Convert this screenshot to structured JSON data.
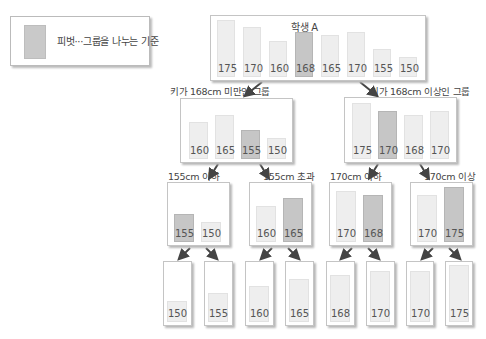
{
  "legend": {
    "label": "피벗···그룹을 나누는 기준",
    "swatch_color": "#c6c6c6"
  },
  "colors": {
    "bar": "#eeeeee",
    "pivot": "#c6c6c6",
    "arrow": "#444444"
  },
  "root": {
    "title": "학생 A",
    "values": [
      "175",
      "170",
      "160",
      "168",
      "165",
      "170",
      "155",
      "150"
    ],
    "pivot_index": 3
  },
  "level1": [
    {
      "label": "키가 168cm 미만인 그룹",
      "values": [
        "160",
        "165",
        "155",
        "150"
      ],
      "pivot_index": 2
    },
    {
      "label": "키가 168cm 이상인 그룹",
      "values": [
        "175",
        "170",
        "168",
        "170"
      ],
      "pivot_index": 1
    }
  ],
  "level2": [
    {
      "label": "155cm 이하",
      "values": [
        "155",
        "150"
      ],
      "pivot_index": 0
    },
    {
      "label": "155cm 초과",
      "values": [
        "160",
        "165"
      ],
      "pivot_index": 1
    },
    {
      "label": "170cm 이하",
      "values": [
        "170",
        "168"
      ],
      "pivot_index": 1
    },
    {
      "label": "170cm 이상",
      "values": [
        "170",
        "175"
      ],
      "pivot_index": 1
    }
  ],
  "leaves": [
    "150",
    "155",
    "160",
    "165",
    "168",
    "170",
    "170",
    "175"
  ]
}
